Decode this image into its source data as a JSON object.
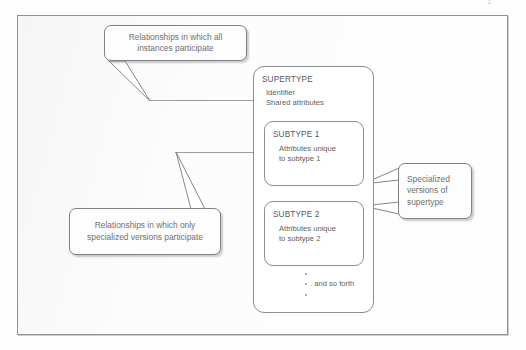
{
  "page": {
    "page_number": "1"
  },
  "figure": {
    "entities": {
      "supertype": {
        "title": "SUPERTYPE",
        "attributes": [
          "Identifier",
          "Shared attributes"
        ]
      },
      "subtype1": {
        "title": "SUBTYPE 1",
        "attributes": [
          "Attributes unique",
          "to subtype 1"
        ]
      },
      "subtype2": {
        "title": "SUBTYPE 2",
        "attributes": [
          "Attributes unique",
          "to subtype 2"
        ]
      },
      "etc": {
        "label": ". and so forth"
      }
    },
    "callouts": {
      "top": "Relationships in which all instances participate",
      "bottom": "Relationships in which only specialized versions participate",
      "right": "Specialized versions of supertype"
    }
  },
  "colors": {
    "frame_border": "#8d9096",
    "box_border": "#8a8d92",
    "text": "#5d6065",
    "callout_text": "#6d7075",
    "background": "#fdfdfd"
  }
}
